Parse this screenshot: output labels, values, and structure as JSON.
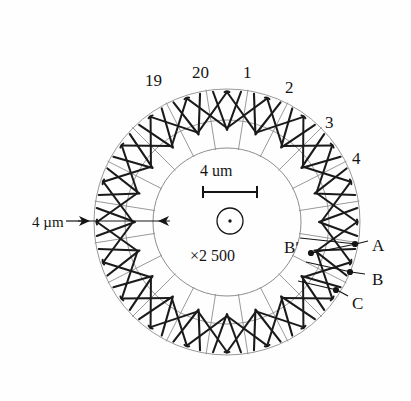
{
  "figure": {
    "background_color": "#fefefe",
    "ink_color": "#151515",
    "thin_line_color": "#8d8d8d",
    "coil_color": "#1a1a1a"
  },
  "geometry": {
    "center_x": 227,
    "center_y": 222,
    "outer_radius": 133,
    "middle_radius": 102,
    "bore_radius": 74,
    "slot_count": 20,
    "coil_span_slots": 2
  },
  "slot_labels": [
    {
      "text": "19",
      "x": 145,
      "y": 72
    },
    {
      "text": "20",
      "x": 192,
      "y": 64
    },
    {
      "text": "1",
      "x": 243,
      "y": 64
    },
    {
      "text": "2",
      "x": 285,
      "y": 79
    },
    {
      "text": "3",
      "x": 325,
      "y": 114
    },
    {
      "text": "4",
      "x": 352,
      "y": 150
    }
  ],
  "terminal_labels": [
    {
      "text": "A",
      "x": 372,
      "y": 237
    },
    {
      "text": "B",
      "x": 372,
      "y": 271
    },
    {
      "text": "C",
      "x": 352,
      "y": 295
    },
    {
      "text": "B′",
      "x": 284,
      "y": 239
    }
  ],
  "terminal_dots": [
    {
      "name": "terminal-dot-a",
      "x": 355,
      "y": 244
    },
    {
      "name": "terminal-dot-b",
      "x": 350,
      "y": 272
    },
    {
      "name": "terminal-dot-c",
      "x": 336,
      "y": 290
    },
    {
      "name": "terminal-dot-b-prime",
      "x": 311,
      "y": 253
    }
  ],
  "center_annotations": {
    "scale_text": "4 um",
    "scale_text_x": 200,
    "scale_text_y": 163,
    "magnification": "×2 500",
    "magnification_x": 190,
    "magnification_y": 248
  },
  "dimension_annotation": {
    "label": "4 µm",
    "label_x": 32,
    "label_y": 215
  }
}
